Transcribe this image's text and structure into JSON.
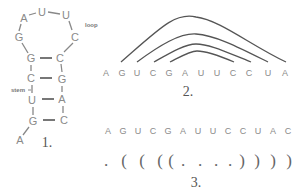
{
  "figure": {
    "panel1": {
      "caption": "1.",
      "loop_label": "loop",
      "stem_label": "stem",
      "nucleotides": [
        {
          "b": "A",
          "x": 20,
          "y": 140
        },
        {
          "b": "G",
          "x": 33,
          "y": 121
        },
        {
          "b": "U",
          "x": 32,
          "y": 100
        },
        {
          "b": "C",
          "x": 31,
          "y": 78
        },
        {
          "b": "G",
          "x": 31,
          "y": 58
        },
        {
          "b": "G",
          "x": 19,
          "y": 37
        },
        {
          "b": "A",
          "x": 24,
          "y": 18
        },
        {
          "b": "U",
          "x": 42,
          "y": 12
        },
        {
          "b": "U",
          "x": 66,
          "y": 15
        },
        {
          "b": "C",
          "x": 75,
          "y": 37
        },
        {
          "b": "C",
          "x": 60,
          "y": 58
        },
        {
          "b": "G",
          "x": 62,
          "y": 79
        },
        {
          "b": "A",
          "x": 62,
          "y": 99
        },
        {
          "b": "C",
          "x": 64,
          "y": 120
        }
      ]
    },
    "panel2": {
      "caption": "2.",
      "sequence": [
        "A",
        "G",
        "U",
        "C",
        "G",
        "A",
        "U",
        "U",
        "C",
        "C",
        "U",
        "A",
        "C"
      ]
    },
    "panel3": {
      "caption": "3.",
      "sequence": [
        "A",
        "G",
        "U",
        "C",
        "G",
        "A",
        "U",
        "U",
        "C",
        "C",
        "U",
        "A",
        "C"
      ],
      "dot_bracket": [
        ".",
        "(",
        "(",
        "(",
        "(",
        ".",
        ".",
        ".",
        ".",
        ")",
        ")",
        ")",
        ")"
      ]
    }
  }
}
